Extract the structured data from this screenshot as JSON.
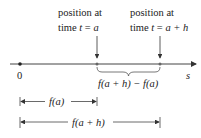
{
  "diagram": {
    "labels": {
      "position_a_line1": "position at",
      "position_a_line2_prefix": "time ",
      "position_a_t": "t",
      "position_a_eq": " = ",
      "position_a_var": "a",
      "position_ah_line1": "position at",
      "position_ah_line2_prefix": "time ",
      "position_ah_t": "t",
      "position_ah_eq": " = ",
      "position_ah_var": "a + h",
      "origin": "0",
      "axis": "s",
      "difference": "f(a + h) − f(a)",
      "fa": "f(a)",
      "fah": "f(a + h)"
    },
    "colors": {
      "line": "#444444",
      "text": "#222222"
    }
  }
}
